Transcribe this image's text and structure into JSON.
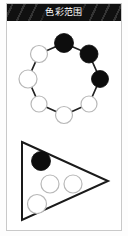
{
  "window": {
    "title": "色彩范围",
    "title_bar_bg": "#101010",
    "title_text_color": "#ffffff",
    "card_bg": "#ffffff",
    "card_border": "#c9c9c9"
  },
  "palette": {
    "filled": "#0d0d0d",
    "empty": "#ffffff",
    "stroke": "#1a1a1a",
    "edge": "#202020",
    "light_stroke": "#b8b8b8"
  },
  "figures": [
    {
      "id": "ring-graph",
      "name": "ring-graph",
      "type": "cycle-graph",
      "node_count": 8,
      "filled_count": 3,
      "empty_count": 5,
      "center": {
        "x": 57,
        "y": 58
      },
      "radius": 36,
      "node_radius": 9,
      "nodes": [
        {
          "index": 0,
          "label": "n1",
          "angle_deg": -90,
          "cx": 57,
          "cy": 22,
          "r": 9.5,
          "fill": "filled"
        },
        {
          "index": 1,
          "label": "n2",
          "angle_deg": -45,
          "cx": 82,
          "cy": 33,
          "r": 9.0,
          "fill": "filled"
        },
        {
          "index": 2,
          "label": "n3",
          "angle_deg": 0,
          "cx": 93,
          "cy": 58,
          "r": 8.5,
          "fill": "filled"
        },
        {
          "index": 3,
          "label": "n4",
          "angle_deg": 45,
          "cx": 82,
          "cy": 83,
          "r": 8.0,
          "fill": "empty"
        },
        {
          "index": 4,
          "label": "n5",
          "angle_deg": 90,
          "cx": 57,
          "cy": 94,
          "r": 8.5,
          "fill": "empty"
        },
        {
          "index": 5,
          "label": "n6",
          "angle_deg": 135,
          "cx": 32,
          "cy": 83,
          "r": 8.0,
          "fill": "empty"
        },
        {
          "index": 6,
          "label": "n7",
          "angle_deg": 180,
          "cx": 21,
          "cy": 58,
          "r": 9.0,
          "fill": "empty"
        },
        {
          "index": 7,
          "label": "n8",
          "angle_deg": -135,
          "cx": 32,
          "cy": 33,
          "r": 8.5,
          "fill": "empty"
        }
      ],
      "edges": [
        {
          "from": 0,
          "to": 1
        },
        {
          "from": 1,
          "to": 2
        },
        {
          "from": 2,
          "to": 3
        },
        {
          "from": 3,
          "to": 4
        },
        {
          "from": 4,
          "to": 5
        },
        {
          "from": 5,
          "to": 6
        },
        {
          "from": 6,
          "to": 7
        },
        {
          "from": 7,
          "to": 0
        }
      ]
    },
    {
      "id": "triangle-shape",
      "name": "triangle-shape",
      "type": "triangle",
      "direction": "right-pointing",
      "filled_count": 1,
      "empty_count": 3,
      "vertices": [
        {
          "x": 15,
          "y": 8
        },
        {
          "x": 101,
          "y": 47
        },
        {
          "x": 15,
          "y": 86
        }
      ],
      "circles": [
        {
          "index": 0,
          "label": "t1",
          "cx": 34,
          "cy": 27,
          "r": 9.5,
          "fill": "filled"
        },
        {
          "index": 1,
          "label": "t2",
          "cx": 43,
          "cy": 50,
          "r": 9.0,
          "fill": "empty"
        },
        {
          "index": 2,
          "label": "t3",
          "cx": 66,
          "cy": 50,
          "r": 9.0,
          "fill": "empty"
        },
        {
          "index": 3,
          "label": "t4",
          "cx": 30,
          "cy": 70,
          "r": 9.5,
          "fill": "empty"
        }
      ]
    }
  ]
}
